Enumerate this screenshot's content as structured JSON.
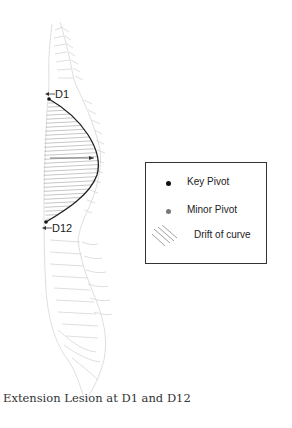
{
  "diagram": {
    "title": "Extension Lesion at D1 and D12",
    "markers": {
      "top": "D1",
      "bottom": "D12"
    },
    "legend": {
      "items": [
        {
          "label": "Key Pivot",
          "symbol": "dot",
          "color": "#111111"
        },
        {
          "label": "Minor Pivot",
          "symbol": "dot",
          "color": "#777777"
        },
        {
          "label": "Drift of curve",
          "symbol": "hatch",
          "color": "#888888"
        }
      ]
    },
    "colors": {
      "curve": "#222222",
      "hatch": "#9a9a9a",
      "spine_outline": "#d4d4d4",
      "legend_border": "#333333"
    }
  }
}
